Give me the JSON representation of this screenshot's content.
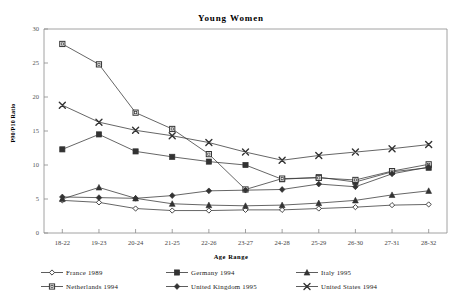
{
  "chart_data": {
    "type": "line",
    "title": "Young Women",
    "xlabel": "Age Range",
    "ylabel": "P90/P10 Ratio",
    "categories": [
      "18-22",
      "19-23",
      "20-24",
      "21-25",
      "22-26",
      "23-27",
      "24-28",
      "25-29",
      "26-30",
      "27-31",
      "28-32"
    ],
    "ylim": [
      0,
      30
    ],
    "yticks": [
      0,
      5,
      10,
      15,
      20,
      25,
      30
    ],
    "grid": false,
    "legend_position": "bottom",
    "series": [
      {
        "name": "France 1989",
        "marker": "open-diamond",
        "values": [
          4.8,
          4.5,
          3.6,
          3.3,
          3.3,
          3.4,
          3.4,
          3.6,
          3.8,
          4.1,
          4.2
        ]
      },
      {
        "name": "Germany 1994",
        "marker": "filled-square",
        "values": [
          12.3,
          14.5,
          12.0,
          11.2,
          10.5,
          10.0,
          7.9,
          8.2,
          7.5,
          9.0,
          9.6
        ]
      },
      {
        "name": "Italy 1995",
        "marker": "filled-triangle",
        "values": [
          5.0,
          6.7,
          5.1,
          4.3,
          4.1,
          4.0,
          4.1,
          4.4,
          4.8,
          5.6,
          6.2
        ]
      },
      {
        "name": "Netherlands 1994",
        "marker": "open-square",
        "values": [
          27.8,
          24.8,
          17.7,
          15.3,
          11.6,
          6.4,
          8.0,
          8.1,
          7.8,
          9.1,
          10.1
        ]
      },
      {
        "name": "United Kingdom 1995",
        "marker": "filled-diamond",
        "values": [
          5.3,
          5.2,
          5.1,
          5.5,
          6.2,
          6.3,
          6.4,
          7.2,
          6.8,
          8.7,
          9.7
        ]
      },
      {
        "name": "United States 1994",
        "marker": "cross-x",
        "values": [
          18.8,
          16.3,
          15.1,
          14.3,
          13.3,
          11.9,
          10.7,
          11.4,
          11.9,
          12.4,
          13.0
        ]
      }
    ]
  },
  "axis": {
    "y_tick_labels": [
      "30",
      "25",
      "20",
      "15",
      "10",
      "5",
      "0"
    ],
    "x_tick_labels": [
      "18-22",
      "19-23",
      "20-24",
      "21-25",
      "22-26",
      "23-27",
      "24-28",
      "25-29",
      "26-30",
      "27-31",
      "28-32"
    ]
  },
  "colors": {
    "line": "#333333",
    "axis": "#888888",
    "text": "#000000"
  }
}
